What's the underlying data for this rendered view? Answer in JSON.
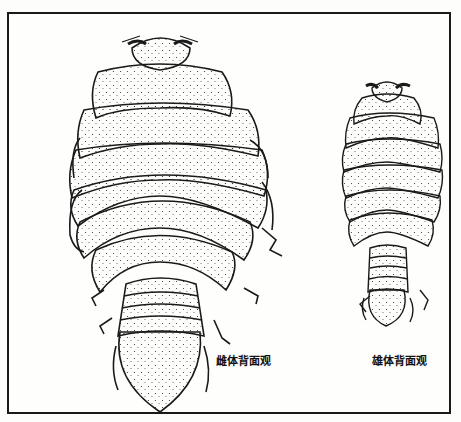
{
  "figure": {
    "captions": {
      "female": "雌体背面观",
      "male": "雄体背面观"
    },
    "colors": {
      "ink": "#1a1a1a",
      "paper": "#fefefc"
    }
  }
}
